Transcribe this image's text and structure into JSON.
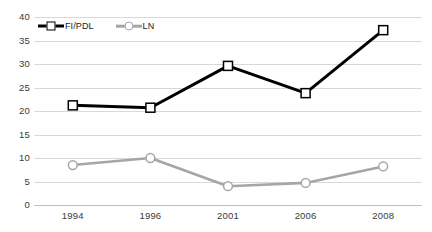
{
  "chart_data": {
    "type": "line",
    "title": "",
    "xlabel": "",
    "ylabel": "",
    "categories": [
      "1994",
      "1996",
      "2001",
      "2006",
      "2008"
    ],
    "ylim": [
      0,
      40
    ],
    "yticks": [
      0,
      5,
      10,
      15,
      20,
      25,
      30,
      35,
      40
    ],
    "grid": "horizontal",
    "legend_position": "top-left-inside",
    "series": [
      {
        "name": "FI/PDL",
        "values": [
          21.2,
          20.7,
          29.6,
          23.8,
          37.2
        ],
        "color": "#000000",
        "marker": "square",
        "marker_fill": "#ffffff",
        "line_width": 3
      },
      {
        "name": "LN",
        "values": [
          8.5,
          10.0,
          4.0,
          4.7,
          8.2
        ],
        "color": "#a6a6a6",
        "marker": "circle",
        "marker_fill": "#ffffff",
        "line_width": 2.6
      }
    ]
  },
  "axes": {
    "y_tick_labels": [
      "40",
      "35",
      "30",
      "25",
      "20",
      "15",
      "10",
      "5",
      "0"
    ],
    "x_tick_labels": [
      "1994",
      "1996",
      "2001",
      "2006",
      "2008"
    ]
  },
  "legend": {
    "entries": [
      {
        "label": "FI/PDL"
      },
      {
        "label": "LN"
      }
    ]
  },
  "colors": {
    "background": "#ffffff",
    "gridline": "#d9d9d9",
    "axis": "#bfbfbf",
    "tick_text": "#3a3a3a",
    "series_1": "#000000",
    "series_2": "#a6a6a6"
  }
}
